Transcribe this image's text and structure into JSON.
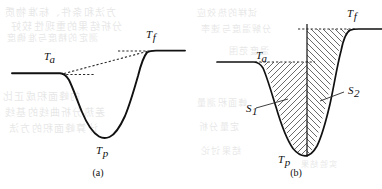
{
  "figure": {
    "kind": "thermal-analysis-endothermic-peak",
    "width": 382,
    "height": 189,
    "background_color": "#ffffff",
    "ink_color": "#111111",
    "dash_color": "#2a2a2a",
    "hatch_color": "#3a3a3a",
    "ghost_color": "#8a8a8a"
  },
  "panels": [
    {
      "id": "a",
      "caption": "(a)",
      "caption_x": 98,
      "caption_y": 174,
      "description": "endothermic peak with dashed onset baseline, dashed peak-to-final tangent and dashed final level line",
      "labels": [
        {
          "name": "onset-temperature",
          "base": "T",
          "sub": "a",
          "italic_sub": false,
          "x": 44,
          "y": 60
        },
        {
          "name": "final-temperature",
          "base": "T",
          "sub": "f",
          "italic_sub": true,
          "x": 146,
          "y": 38
        },
        {
          "name": "peak-temperature",
          "base": "T",
          "sub": "p",
          "italic_sub": false,
          "x": 96,
          "y": 154
        }
      ]
    },
    {
      "id": "b",
      "caption": "(b)",
      "caption_x": 296,
      "caption_y": 174,
      "description": "same peak with two hatched areas S1 and S2 separated by a vertical line at the peak minimum",
      "labels": [
        {
          "name": "onset-temperature",
          "base": "T",
          "sub": "a",
          "italic_sub": false,
          "x": 258,
          "y": 59
        },
        {
          "name": "final-temperature",
          "base": "T",
          "sub": "f",
          "italic_sub": true,
          "x": 348,
          "y": 16
        },
        {
          "name": "peak-temperature",
          "base": "T",
          "sub": "p",
          "italic_sub": false,
          "x": 279,
          "y": 161
        },
        {
          "name": "area-s1",
          "base": "S",
          "sub": "1",
          "italic_sub": false,
          "x": 246,
          "y": 112
        },
        {
          "name": "area-s2",
          "base": "S",
          "sub": "2",
          "italic_sub": false,
          "x": 348,
          "y": 94
        }
      ],
      "areas": [
        {
          "name": "S1",
          "label": "S₁",
          "hatch_direction": "forward-slash"
        },
        {
          "name": "S2",
          "label": "S₂",
          "hatch_direction": "back-slash"
        }
      ]
    }
  ],
  "chart_data": {
    "type": "line",
    "title": "",
    "xlabel": "",
    "ylabel": "",
    "grid": false,
    "legend_position": "none",
    "note": "y values are screen pixel coordinates (smaller y = higher signal); curve is an endothermic trough",
    "series": [
      {
        "name": "panel-a-curve",
        "points": [
          [
            12,
            73
          ],
          [
            40,
            73
          ],
          [
            58,
            73
          ],
          [
            64,
            74
          ],
          [
            70,
            80
          ],
          [
            76,
            92
          ],
          [
            82,
            107
          ],
          [
            88,
            120
          ],
          [
            94,
            130
          ],
          [
            100,
            136
          ],
          [
            106,
            137
          ],
          [
            112,
            135
          ],
          [
            118,
            129
          ],
          [
            124,
            118
          ],
          [
            130,
            103
          ],
          [
            136,
            86
          ],
          [
            141,
            68
          ],
          [
            145,
            57
          ],
          [
            150,
            52
          ],
          [
            158,
            51
          ],
          [
            172,
            51
          ],
          [
            185,
            51
          ]
        ]
      },
      {
        "name": "panel-b-curve",
        "points": [
          [
            217,
            62
          ],
          [
            240,
            62
          ],
          [
            255,
            62
          ],
          [
            262,
            63
          ],
          [
            268,
            69
          ],
          [
            274,
            81
          ],
          [
            280,
            97
          ],
          [
            286,
            113
          ],
          [
            292,
            130
          ],
          [
            297,
            144
          ],
          [
            302,
            152
          ],
          [
            307,
            154
          ],
          [
            312,
            152
          ],
          [
            317,
            145
          ],
          [
            322,
            132
          ],
          [
            327,
            114
          ],
          [
            332,
            93
          ],
          [
            337,
            72
          ],
          [
            341,
            51
          ],
          [
            345,
            36
          ],
          [
            350,
            30
          ],
          [
            358,
            29
          ],
          [
            370,
            29
          ],
          [
            382,
            29
          ]
        ]
      }
    ],
    "reference_lines": [
      {
        "name": "panel-a-onset-dash",
        "type": "horizontal-dashed",
        "x1": 62,
        "y1": 74,
        "x2": 92,
        "y2": 74
      },
      {
        "name": "panel-a-tangent-dash",
        "type": "diagonal-dashed",
        "x1": 63,
        "y1": 74,
        "x2": 146,
        "y2": 52
      },
      {
        "name": "panel-a-final-dash",
        "type": "horizontal-dashed",
        "x1": 119,
        "y1": 51,
        "x2": 150,
        "y2": 51
      },
      {
        "name": "panel-b-onset-dash",
        "type": "horizontal-dashed",
        "x1": 258,
        "y1": 62,
        "x2": 312,
        "y2": 62
      },
      {
        "name": "panel-b-final-dash",
        "type": "horizontal-dashed",
        "x1": 299,
        "y1": 29,
        "x2": 352,
        "y2": 29
      },
      {
        "name": "panel-b-peak-divider",
        "type": "vertical-solid",
        "x1": 307,
        "y1": 24,
        "x2": 307,
        "y2": 156
      }
    ],
    "annotations": [
      {
        "text": "Tₐ",
        "panel": "a",
        "meaning": "onset temperature"
      },
      {
        "text": "T_f",
        "panel": "a",
        "meaning": "final temperature"
      },
      {
        "text": "T_p",
        "panel": "a",
        "meaning": "peak temperature"
      },
      {
        "text": "Tₐ",
        "panel": "b",
        "meaning": "onset temperature"
      },
      {
        "text": "T_f",
        "panel": "b",
        "meaning": "final temperature"
      },
      {
        "text": "T_p",
        "panel": "b",
        "meaning": "peak temperature"
      },
      {
        "text": "S₁",
        "panel": "b",
        "meaning": "left peak area"
      },
      {
        "text": "S₂",
        "panel": "b",
        "meaning": "right peak area"
      }
    ]
  },
  "ghost_text": {
    "note": "faint bleed-through from the reverse side of the scanned page",
    "lines": [
      {
        "text": "方法和条件、标准物质",
        "x": 4,
        "y": 4,
        "size": 10
      },
      {
        "text": "分析结果的重现性较好",
        "x": 10,
        "y": 18,
        "size": 10
      },
      {
        "text": "测定的精度与准确度",
        "x": 6,
        "y": 31,
        "size": 9
      },
      {
        "text": "的峰面积成正比",
        "x": 2,
        "y": 88,
        "size": 10
      },
      {
        "text": "差热分析曲线的基线",
        "x": 4,
        "y": 104,
        "size": 10
      },
      {
        "text": "计算峰面积的方法",
        "x": 8,
        "y": 120,
        "size": 10
      },
      {
        "text": "试样的热效应",
        "x": 196,
        "y": 6,
        "size": 9
      },
      {
        "text": "分解温度与速率",
        "x": 200,
        "y": 22,
        "size": 9
      },
      {
        "text": "温度范围",
        "x": 228,
        "y": 44,
        "size": 9
      },
      {
        "text": "峰面积测量",
        "x": 196,
        "y": 96,
        "size": 9
      },
      {
        "text": "定量分析",
        "x": 198,
        "y": 120,
        "size": 9
      },
      {
        "text": "结果讨论",
        "x": 200,
        "y": 144,
        "size": 9
      },
      {
        "text": "实验结果",
        "x": 300,
        "y": 158,
        "size": 8
      }
    ]
  }
}
